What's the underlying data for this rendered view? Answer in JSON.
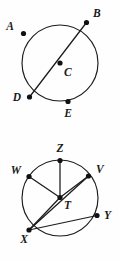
{
  "document": {
    "title": "Circle Diagrams",
    "background_color": "#fefefe",
    "stroke_color": "#1b1b1b",
    "point_color": "#111111"
  },
  "figures": [
    {
      "id": "figure-top",
      "name": "circle-c",
      "center_label": "C",
      "circle": {
        "cx": 60,
        "cy": 63,
        "r": 38
      },
      "points": [
        {
          "id": "A",
          "label": "A",
          "cx": 23.5,
          "cy": 33.5,
          "lx": 14,
          "ly": 30,
          "anchor": "end",
          "on_circle": true
        },
        {
          "id": "B",
          "label": "B",
          "cx": 86.5,
          "cy": 22.5,
          "lx": 93,
          "ly": 17,
          "anchor": "start",
          "on_circle": true
        },
        {
          "id": "C",
          "label": "C",
          "cx": 60.0,
          "cy": 63.0,
          "lx": 64,
          "ly": 76,
          "anchor": "start",
          "on_circle": false
        },
        {
          "id": "D",
          "label": "D",
          "cx": 29.5,
          "cy": 97.0,
          "lx": 21,
          "ly": 101,
          "anchor": "end",
          "on_circle": true
        },
        {
          "id": "E",
          "label": "E",
          "cx": 68.0,
          "cy": 101.5,
          "lx": 68,
          "ly": 117,
          "anchor": "middle",
          "on_circle": true
        }
      ],
      "segments": [
        {
          "id": "BD",
          "label": "diameter-b-d",
          "from": "B",
          "to": "D"
        }
      ]
    },
    {
      "id": "figure-bottom",
      "name": "circle-t",
      "center_label": "T",
      "circle": {
        "cx": 60,
        "cy": 68,
        "r": 38
      },
      "points": [
        {
          "id": "Z",
          "label": "Z",
          "cx": 60.0,
          "cy": 30.5,
          "lx": 60,
          "ly": 22,
          "anchor": "middle",
          "on_circle": true
        },
        {
          "id": "W",
          "label": "W",
          "cx": 29.0,
          "cy": 46.5,
          "lx": 21,
          "ly": 44,
          "anchor": "end",
          "on_circle": true
        },
        {
          "id": "V",
          "label": "V",
          "cx": 88.5,
          "cy": 46.0,
          "lx": 96,
          "ly": 43,
          "anchor": "start",
          "on_circle": true
        },
        {
          "id": "T",
          "label": "T",
          "cx": 60.0,
          "cy": 67.5,
          "lx": 64,
          "ly": 79,
          "anchor": "start",
          "on_circle": false
        },
        {
          "id": "X",
          "label": "X",
          "cx": 29.0,
          "cy": 100.0,
          "lx": 24,
          "ly": 113,
          "anchor": "middle",
          "on_circle": true
        },
        {
          "id": "Y",
          "label": "Y",
          "cx": 97.0,
          "cy": 85.5,
          "lx": 104,
          "ly": 89,
          "anchor": "start",
          "on_circle": true
        }
      ],
      "segments": [
        {
          "id": "ZT",
          "label": "radius-z-t",
          "from": "Z",
          "to": "T"
        },
        {
          "id": "WT",
          "label": "radius-w-t",
          "from": "W",
          "to": "T"
        },
        {
          "id": "VT",
          "label": "radius-v-t",
          "from": "V",
          "to": "T"
        },
        {
          "id": "XT",
          "label": "radius-x-t",
          "from": "X",
          "to": "T"
        },
        {
          "id": "XV",
          "label": "chord-x-v",
          "from": "X",
          "to": "V"
        },
        {
          "id": "XY",
          "label": "chord-x-y",
          "from": "X",
          "to": "Y"
        }
      ]
    }
  ]
}
